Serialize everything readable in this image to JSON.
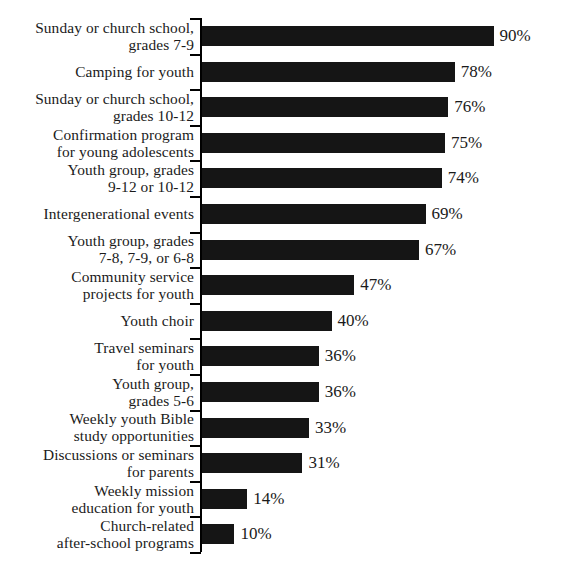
{
  "chart_data": {
    "type": "bar",
    "orientation": "horizontal",
    "title": "",
    "subtitle": "",
    "xlabel": "",
    "ylabel": "",
    "xlim": [
      0,
      100
    ],
    "grid": false,
    "legend": null,
    "value_suffix": "%",
    "bar_color": "#151515",
    "axis_color": "#000000",
    "background_color": "#ffffff",
    "categories": [
      "Sunday or church school, grades 7-9",
      "Camping for youth",
      "Sunday or church school, grades 10-12",
      "Confirmation program for young adolescents",
      "Youth group, grades 9-12 or 10-12",
      "Intergenerational events",
      "Youth group, grades 7-8, 7-9, or 6-8",
      "Community service projects for youth",
      "Youth choir",
      "Travel seminars for youth",
      "Youth group, grades 5-6",
      "Weekly youth Bible study opportunities",
      "Discussions or seminars for parents",
      "Weekly mission education for youth",
      "Church-related after-school programs"
    ],
    "category_lines": [
      [
        "Sunday or church school,",
        "grades 7-9"
      ],
      [
        "Camping for youth"
      ],
      [
        "Sunday or church school,",
        "grades 10-12"
      ],
      [
        "Confirmation program",
        "for young adolescents"
      ],
      [
        "Youth group, grades",
        "9-12 or 10-12"
      ],
      [
        "Intergenerational events"
      ],
      [
        "Youth group, grades",
        "7-8, 7-9, or 6-8"
      ],
      [
        "Community service",
        "projects for youth"
      ],
      [
        "Youth choir"
      ],
      [
        "Travel seminars",
        "for youth"
      ],
      [
        "Youth group,",
        "grades 5-6"
      ],
      [
        "Weekly youth Bible",
        "study opportunities"
      ],
      [
        "Discussions or seminars",
        "for parents"
      ],
      [
        "Weekly mission",
        "education for youth"
      ],
      [
        "Church-related",
        "after-school programs"
      ]
    ],
    "values": [
      90,
      78,
      76,
      75,
      74,
      69,
      67,
      47,
      40,
      36,
      36,
      33,
      31,
      14,
      10
    ],
    "value_labels": [
      "90%",
      "78%",
      "76%",
      "75%",
      "74%",
      "69%",
      "67%",
      "47%",
      "40%",
      "36%",
      "36%",
      "33%",
      "31%",
      "14%",
      "10%"
    ]
  }
}
